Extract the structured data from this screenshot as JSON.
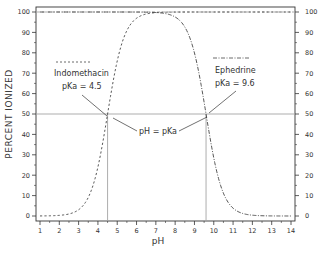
{
  "chart_data": {
    "type": "line",
    "title": "",
    "xlabel": "pH",
    "ylabel": "PERCENT IONIZED",
    "xlim": [
      1,
      14
    ],
    "ylim": [
      0,
      100
    ],
    "x_ticks": [
      1,
      2,
      3,
      4,
      5,
      6,
      7,
      8,
      9,
      10,
      11,
      12,
      13,
      14
    ],
    "y_ticks": [
      0,
      10,
      20,
      30,
      40,
      50,
      60,
      70,
      80,
      90,
      100
    ],
    "y_ticks_right": [
      0,
      10,
      20,
      30,
      40,
      50,
      60,
      70,
      80,
      90,
      100
    ],
    "grid": false,
    "series": [
      {
        "name": "Indomethacin",
        "pKa": 4.5,
        "line_style": "dashed",
        "x": [
          1,
          2,
          3,
          3.5,
          4,
          4.5,
          5,
          5.5,
          6,
          7,
          8,
          9,
          10,
          11,
          12,
          13,
          14
        ],
        "values": [
          0.0,
          0.3,
          3.1,
          9.1,
          24.0,
          50.0,
          76.0,
          90.9,
          96.9,
          99.7,
          100,
          100,
          100,
          100,
          100,
          100,
          100
        ]
      },
      {
        "name": "Ephedrine",
        "pKa": 9.6,
        "line_style": "dash-dot",
        "x": [
          1,
          2,
          3,
          4,
          5,
          6,
          7,
          8,
          8.6,
          9,
          9.6,
          10,
          10.6,
          11,
          12,
          13,
          14
        ],
        "values": [
          100,
          100,
          100,
          100,
          100,
          100,
          99.7,
          97.5,
          90.9,
          79.9,
          50.0,
          28.5,
          9.1,
          3.8,
          0.4,
          0.0,
          0.0
        ]
      }
    ],
    "reference_lines": [
      {
        "type": "horizontal",
        "y": 100
      },
      {
        "type": "horizontal",
        "y": 50
      },
      {
        "type": "vertical",
        "x": 4.5
      },
      {
        "type": "vertical",
        "x": 9.6
      }
    ],
    "annotations": [
      {
        "text": "Indomethacin",
        "x": 2.6,
        "y": 69
      },
      {
        "text": "pKa = 4.5",
        "x": 2.6,
        "y": 63
      },
      {
        "text": "Ephedrine",
        "x": 10.5,
        "y": 69
      },
      {
        "text": "pKa = 9.6",
        "x": 10.5,
        "y": 63
      },
      {
        "text": "pH = pKa",
        "x": 7.0,
        "y": 44
      }
    ],
    "legend_position": "inline annotations"
  },
  "labels": {
    "ylabel": "PERCENT IONIZED",
    "xlabel": "pH",
    "indomethacin_name": "Indomethacin",
    "indomethacin_pka": "pKa = 4.5",
    "ephedrine_name": "Ephedrine",
    "ephedrine_pka": "pKa = 9.6",
    "ph_eq_pka": "pH = pKa"
  },
  "colors": {
    "line": "#444444",
    "axis": "#333333",
    "text": "#333333",
    "background": "#ffffff"
  }
}
